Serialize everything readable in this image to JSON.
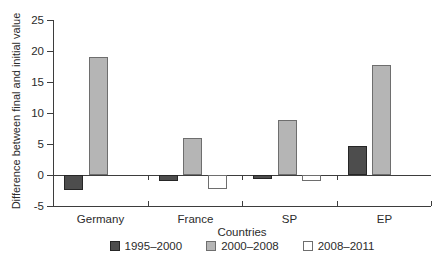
{
  "chart_data": {
    "type": "bar",
    "title": "",
    "xlabel": "Countries",
    "ylabel": "Difference between final and initial value",
    "categories": [
      "Germany",
      "France",
      "SP",
      "EP"
    ],
    "series": [
      {
        "name": "1995–2000",
        "color": "#4d4d4d",
        "border_color": "#262626",
        "values": [
          -2.4,
          -0.9,
          -0.7,
          4.6
        ]
      },
      {
        "name": "2000–2008",
        "color": "#b5b5b5",
        "border_color": "#6e6e6e",
        "values": [
          19.0,
          5.9,
          8.8,
          17.8
        ]
      },
      {
        "name": "2008–2011",
        "color": "#ffffff",
        "border_color": "#6e6e6e",
        "values": [
          0,
          -2.2,
          -0.9,
          0
        ]
      }
    ],
    "ylim": [
      -5,
      25
    ],
    "yticks": [
      25,
      20,
      15,
      10,
      5,
      0,
      -5
    ],
    "grid": false,
    "legend_position": "bottom",
    "axis_color": "#3d3d3d",
    "background_color": "#ffffff"
  }
}
